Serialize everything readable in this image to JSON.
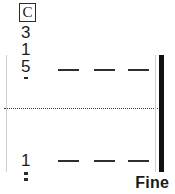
{
  "score": {
    "time_signature": {
      "symbol": "C",
      "boxed": true
    },
    "measure_numbers": [
      {
        "value": "3"
      },
      {
        "value": "1"
      },
      {
        "value": "5"
      },
      {
        "value": "1"
      }
    ],
    "staff_rows": [
      {
        "row": "top",
        "dashes": [
          "—",
          "—",
          "—"
        ]
      },
      {
        "row": "bottom",
        "dashes": [
          "—",
          "—",
          "—"
        ]
      }
    ],
    "divider": {
      "style": "dotted"
    },
    "final_barline": {
      "style": "thick"
    },
    "marking": {
      "label": "Fine"
    },
    "colors": {
      "ink": "#1a1a1a",
      "dash": "#2e2e2e",
      "rule": "#cfcfcf",
      "barline": "#111111",
      "background": "#ffffff"
    }
  }
}
